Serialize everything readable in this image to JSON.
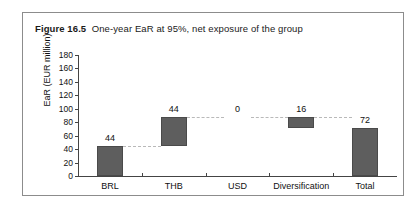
{
  "figure": {
    "label": "Figure 16.5",
    "caption": "One-year EaR at 95%, net exposure of the group"
  },
  "chart_data": {
    "type": "bar",
    "subtype": "waterfall",
    "title": "One-year EaR at 95%, net exposure of the group",
    "xlabel": "",
    "ylabel": "EaR (EUR million)",
    "ylim": [
      0,
      180
    ],
    "ytick_step": 20,
    "yticks": [
      0,
      20,
      40,
      60,
      80,
      100,
      120,
      140,
      160,
      180
    ],
    "grid": false,
    "legend": "none",
    "categories": [
      "BRL",
      "THB",
      "USD",
      "Diversification",
      "Total"
    ],
    "values": [
      44,
      44,
      0,
      16,
      72
    ],
    "value_labels": [
      "44",
      "44",
      "0",
      "16",
      "72"
    ],
    "bar_segments": [
      {
        "category": "BRL",
        "base": 0,
        "top": 44,
        "value": 44,
        "kind": "increase"
      },
      {
        "category": "THB",
        "base": 44,
        "top": 88,
        "value": 44,
        "kind": "increase"
      },
      {
        "category": "USD",
        "base": 88,
        "top": 88,
        "value": 0,
        "kind": "zero"
      },
      {
        "category": "Diversification",
        "base": 72,
        "top": 88,
        "value": 16,
        "kind": "decrease"
      },
      {
        "category": "Total",
        "base": 0,
        "top": 72,
        "value": 72,
        "kind": "total"
      }
    ],
    "series": [
      {
        "name": "EaR (EUR million)",
        "values": [
          44,
          44,
          0,
          16,
          72
        ]
      }
    ],
    "colors": {
      "bar_fill": "#5e5e5e",
      "bar_stroke": "#4a4a4a",
      "axis": "#444444",
      "connector": "#b9b9b9",
      "frame": "#8c8c8c",
      "text": "#111111"
    }
  }
}
